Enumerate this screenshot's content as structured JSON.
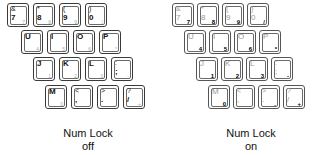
{
  "panels": [
    {
      "id": "off",
      "caption_line1": "Num Lock",
      "caption_line2": "off",
      "rows": [
        [
          {
            "top": "&",
            "main": "7",
            "num": "7"
          },
          {
            "top": "*",
            "main": "8",
            "num": "8"
          },
          {
            "top": "(",
            "main": "9",
            "num": "9"
          },
          {
            "top": ")",
            "main": "0",
            "num": "/"
          }
        ],
        [
          {
            "top": "",
            "main": "U",
            "num": "4"
          },
          {
            "top": "",
            "main": "I",
            "num": "5"
          },
          {
            "top": "",
            "main": "O",
            "num": "6"
          },
          {
            "top": "",
            "main": "P",
            "num": "*"
          }
        ],
        [
          {
            "top": "",
            "main": "J",
            "num": "1"
          },
          {
            "top": "",
            "main": "K",
            "num": "2"
          },
          {
            "top": "",
            "main": "L",
            "num": "3"
          },
          {
            "top": ":",
            "main": ";",
            "num": "-"
          }
        ],
        [
          {
            "top": "",
            "main": "M",
            "num": "0"
          },
          {
            "top": "<",
            "main": ",",
            "num": ""
          },
          {
            "top": ">",
            "main": ".",
            "num": "."
          },
          {
            "top": "?",
            "main": "/",
            "num": "+"
          }
        ]
      ]
    },
    {
      "id": "on",
      "caption_line1": "Num Lock",
      "caption_line2": "on",
      "rows": [
        [
          {
            "top": "&",
            "main": "7",
            "num": "7"
          },
          {
            "top": "*",
            "main": "8",
            "num": "8"
          },
          {
            "top": "(",
            "main": "9",
            "num": "9"
          },
          {
            "top": ")",
            "main": "0",
            "num": "/"
          }
        ],
        [
          {
            "top": "",
            "main": "U",
            "num": "4"
          },
          {
            "top": "",
            "main": "I",
            "num": "5"
          },
          {
            "top": "",
            "main": "O",
            "num": "6"
          },
          {
            "top": "",
            "main": "P",
            "num": "*"
          }
        ],
        [
          {
            "top": "",
            "main": "J",
            "num": "1"
          },
          {
            "top": "",
            "main": "K",
            "num": "2"
          },
          {
            "top": "",
            "main": "L",
            "num": "3"
          },
          {
            "top": ":",
            "main": ";",
            "num": "-"
          }
        ],
        [
          {
            "top": "",
            "main": "M",
            "num": "0"
          },
          {
            "top": "<",
            "main": ",",
            "num": ""
          },
          {
            "top": ">",
            "main": ".",
            "num": "."
          },
          {
            "top": "?",
            "main": "/",
            "num": "+"
          }
        ]
      ]
    }
  ]
}
